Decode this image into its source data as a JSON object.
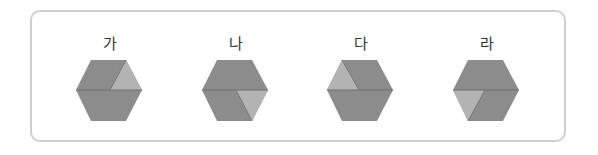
{
  "figures": [
    {
      "label": "가",
      "light_piece": "top-right"
    },
    {
      "label": "나",
      "light_piece": "bottom-right"
    },
    {
      "label": "다",
      "light_piece": "top-left"
    },
    {
      "label": "라",
      "light_piece": "bottom-left"
    }
  ],
  "colors": {
    "dark": "#8c8c8c",
    "light": "#b3b3b3",
    "edge": "#6e6e6e",
    "border": "#cfcfcf"
  }
}
